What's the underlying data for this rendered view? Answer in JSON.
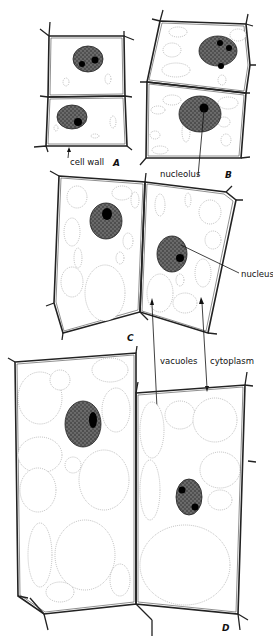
{
  "figure": {
    "stages": [
      {
        "id": "A",
        "label": "A"
      },
      {
        "id": "B",
        "label": "B"
      },
      {
        "id": "C",
        "label": "C"
      },
      {
        "id": "D",
        "label": "D"
      }
    ],
    "labels": {
      "cell_wall": "cell wall",
      "nucleolus": "nucleolus",
      "nucleus": "nucleus",
      "vacuoles": "vacuoles",
      "cytoplasm": "cytoplasm"
    },
    "colors": {
      "ink": "#111111",
      "background": "#ffffff",
      "cytoplasm_stipple": "#555555",
      "nucleus_fill": "#333333"
    }
  }
}
